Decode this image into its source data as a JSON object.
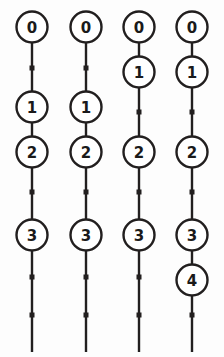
{
  "figure": {
    "title": "",
    "background_color": "#fdfdfd",
    "stroke_color": "#221f1f",
    "node_fill_color": "#ffffff",
    "label_color": "#1a1a1a",
    "width": 224,
    "height": 357,
    "node_radius": 15.5,
    "tick_size": 5,
    "line_width": 2.4
  },
  "chart_data": {
    "type": "diagram",
    "subtype": "vertical-timeline-lattice",
    "title": "",
    "xlabel": "",
    "ylabel": "",
    "columns": [
      {
        "name": "column-1",
        "x": 32,
        "line_top": 43,
        "line_bottom": 352,
        "nodes": [
          {
            "label": "0",
            "y": 27
          },
          {
            "label": "1",
            "y": 107
          },
          {
            "label": "2",
            "y": 152
          },
          {
            "label": "3",
            "y": 235
          }
        ],
        "ticks": [
          {
            "y": 68
          },
          {
            "y": 192
          },
          {
            "y": 277
          },
          {
            "y": 315
          }
        ]
      },
      {
        "name": "column-2",
        "x": 86,
        "line_top": 43,
        "line_bottom": 352,
        "nodes": [
          {
            "label": "0",
            "y": 27
          },
          {
            "label": "1",
            "y": 107
          },
          {
            "label": "2",
            "y": 152
          },
          {
            "label": "3",
            "y": 235
          }
        ],
        "ticks": [
          {
            "y": 68
          },
          {
            "y": 192
          },
          {
            "y": 277
          },
          {
            "y": 315
          }
        ]
      },
      {
        "name": "column-3",
        "x": 139,
        "line_top": 43,
        "line_bottom": 352,
        "nodes": [
          {
            "label": "0",
            "y": 27
          },
          {
            "label": "1",
            "y": 72
          },
          {
            "label": "2",
            "y": 152
          },
          {
            "label": "3",
            "y": 235
          }
        ],
        "ticks": [
          {
            "y": 112
          },
          {
            "y": 192
          },
          {
            "y": 277
          },
          {
            "y": 315
          }
        ]
      },
      {
        "name": "column-4",
        "x": 192,
        "line_top": 43,
        "line_bottom": 352,
        "nodes": [
          {
            "label": "0",
            "y": 27
          },
          {
            "label": "1",
            "y": 72
          },
          {
            "label": "2",
            "y": 152
          },
          {
            "label": "3",
            "y": 235
          },
          {
            "label": "4",
            "y": 280
          }
        ],
        "ticks": [
          {
            "y": 112
          },
          {
            "y": 192
          },
          {
            "y": 315
          }
        ]
      }
    ]
  }
}
